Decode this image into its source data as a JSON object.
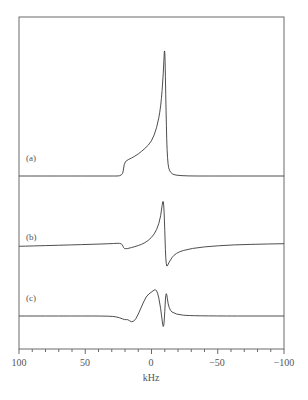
{
  "chart_data": {
    "type": "line",
    "title": "",
    "xlabel": "kHz",
    "ylabel": "",
    "xlim": [
      100,
      -100
    ],
    "x_reversed": true,
    "grid": false,
    "legend": "inline labels at left of each trace",
    "xticks_major": [
      100,
      50,
      0,
      -50,
      -100
    ],
    "xtick_labels": [
      "100",
      "50",
      "0",
      "−50",
      "−100"
    ],
    "xticks_minor_step": 10,
    "series": [
      {
        "name": "(a)",
        "label": "(a)",
        "description": "Absorption powder pattern: flat baseline, step near +21 kHz, rising shoulder to a sharp peak at about -10 kHz, then rapid fall to baseline.",
        "x": [
          100,
          60,
          30,
          22,
          21,
          20,
          15,
          10,
          5,
          0,
          -4,
          -7,
          -9,
          -10,
          -11,
          -12,
          -14,
          -20,
          -50,
          -100
        ],
        "y": [
          0,
          0,
          0,
          0,
          0.06,
          0.11,
          0.13,
          0.16,
          0.2,
          0.25,
          0.35,
          0.5,
          0.75,
          1.0,
          0.45,
          0.1,
          0.02,
          0.0,
          0.0,
          0.0
        ]
      },
      {
        "name": "(b)",
        "label": "(b)",
        "description": "Dispersion-like spectrum: slowly rising baseline, small step down near +21 kHz, steep rise to a sharp positive peak near -9 kHz, sharp negative swing near -11 kHz, slow recovery toward baseline.",
        "x": [
          100,
          60,
          30,
          22,
          21,
          15,
          10,
          5,
          0,
          -4,
          -7,
          -9,
          -10,
          -11,
          -13,
          -18,
          -30,
          -50,
          -75,
          -100
        ],
        "y": [
          -0.05,
          -0.03,
          -0.01,
          0.0,
          -0.1,
          -0.07,
          -0.04,
          0.0,
          0.08,
          0.2,
          0.4,
          0.75,
          0.2,
          -0.4,
          -0.3,
          -0.15,
          -0.08,
          -0.04,
          -0.02,
          -0.01
        ]
      },
      {
        "name": "(c)",
        "label": "(c)",
        "description": "Derivative-like spectrum: flat baseline, small negative dip around +20 to +15 kHz, rise to broad positive maximum near -3 kHz, sharp negative spike near -9 kHz, small positive spike near -11 kHz, then return to baseline.",
        "x": [
          100,
          60,
          30,
          24,
          20,
          18,
          15,
          12,
          8,
          4,
          0,
          -4,
          -7,
          -9,
          -10,
          -11,
          -13,
          -18,
          -30,
          -100
        ],
        "y": [
          0,
          0,
          0,
          -0.02,
          -0.05,
          -0.04,
          -0.08,
          -0.05,
          0.1,
          0.25,
          0.3,
          0.35,
          0.1,
          -0.2,
          0.05,
          0.35,
          0.08,
          0.02,
          0.0,
          0.0
        ]
      }
    ]
  },
  "axis": {
    "xlabel": "kHz",
    "tick_labels": [
      "100",
      "50",
      "0",
      "−50",
      "−100"
    ]
  },
  "labels": {
    "a": "(a)",
    "b": "(b)",
    "c": "(c)"
  }
}
